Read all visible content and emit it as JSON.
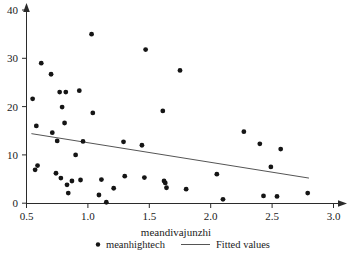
{
  "chart_data": {
    "type": "scatter",
    "title": "",
    "xlabel": "meandivajunzhi",
    "ylabel": "",
    "xlim": [
      0.5,
      3.05
    ],
    "ylim": [
      0,
      42
    ],
    "grid": false,
    "legend_position": "bottom",
    "xticks": [
      0.5,
      1.0,
      1.5,
      2.0,
      2.5,
      3.0
    ],
    "xtick_labels": [
      "0.5",
      "1.0",
      "1.5",
      "2.0",
      "2.5",
      "3.0"
    ],
    "yticks": [
      0,
      10,
      20,
      30,
      40
    ],
    "ytick_labels": [
      "0",
      "10",
      "20",
      "30",
      "40"
    ],
    "series": [
      {
        "name": "meanhightech",
        "type": "scatter",
        "marker": "filled-circle",
        "color": "#151515",
        "points": [
          [
            0.55,
            21.6
          ],
          [
            0.58,
            16.0
          ],
          [
            0.57,
            6.9
          ],
          [
            0.59,
            7.8
          ],
          [
            0.62,
            29.0
          ],
          [
            0.7,
            26.7
          ],
          [
            0.71,
            14.6
          ],
          [
            0.75,
            12.9
          ],
          [
            0.74,
            6.2
          ],
          [
            0.77,
            23.0
          ],
          [
            0.79,
            19.9
          ],
          [
            0.78,
            5.2
          ],
          [
            0.82,
            23.0
          ],
          [
            0.81,
            16.6
          ],
          [
            0.83,
            3.8
          ],
          [
            0.84,
            2.1
          ],
          [
            0.87,
            4.6
          ],
          [
            0.9,
            10.0
          ],
          [
            0.93,
            23.3
          ],
          [
            0.94,
            4.8
          ],
          [
            0.96,
            12.8
          ],
          [
            1.03,
            35.0
          ],
          [
            1.04,
            18.7
          ],
          [
            1.09,
            1.7
          ],
          [
            1.11,
            4.9
          ],
          [
            1.15,
            0.2
          ],
          [
            1.21,
            3.1
          ],
          [
            1.29,
            12.7
          ],
          [
            1.3,
            5.6
          ],
          [
            1.44,
            12.0
          ],
          [
            1.47,
            31.8
          ],
          [
            1.46,
            5.3
          ],
          [
            1.61,
            19.1
          ],
          [
            1.62,
            4.6
          ],
          [
            1.63,
            4.2
          ],
          [
            1.64,
            3.2
          ],
          [
            1.75,
            27.5
          ],
          [
            1.8,
            2.9
          ],
          [
            2.05,
            6.0
          ],
          [
            2.1,
            0.8
          ],
          [
            2.27,
            14.8
          ],
          [
            2.4,
            12.3
          ],
          [
            2.43,
            1.5
          ],
          [
            2.49,
            7.5
          ],
          [
            2.54,
            1.4
          ],
          [
            2.57,
            11.2
          ],
          [
            2.79,
            2.1
          ]
        ]
      },
      {
        "name": "Fitted values",
        "type": "line",
        "color": "#555555",
        "endpoints": [
          [
            0.54,
            14.4
          ],
          [
            2.8,
            5.2
          ]
        ]
      }
    ]
  },
  "legend": {
    "items": [
      {
        "label": "meanhightech",
        "glyph": "filled-circle-marker"
      },
      {
        "label": "Fitted values",
        "glyph": "line-segment"
      }
    ]
  },
  "axes": {
    "x_title": "meandivajunzhi"
  }
}
